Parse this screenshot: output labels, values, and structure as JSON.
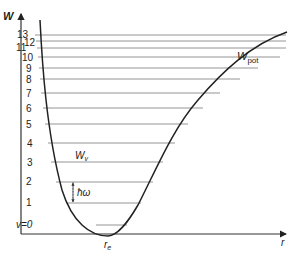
{
  "diagram": {
    "y_axis_label": "W",
    "x_axis_label": "r",
    "curve_label_main": "W",
    "curve_label_sub": "pot",
    "level_energy_label_main": "W",
    "level_energy_label_sub": "v",
    "spacing_label": "ħω",
    "equilibrium_label_main": "r",
    "equilibrium_label_sub": "e",
    "levels": [
      {
        "label": "v=0",
        "y": 225,
        "x1": 96,
        "x2": 127
      },
      {
        "label": "1",
        "y": 203,
        "x1": 66,
        "x2": 141
      },
      {
        "label": "2",
        "y": 182,
        "x1": 56,
        "x2": 153
      },
      {
        "label": "3",
        "y": 162,
        "x1": 51,
        "x2": 163
      },
      {
        "label": "4",
        "y": 143,
        "x1": 48,
        "x2": 175
      },
      {
        "label": "5",
        "y": 124,
        "x1": 45,
        "x2": 188
      },
      {
        "label": "6",
        "y": 108,
        "x1": 43,
        "x2": 203
      },
      {
        "label": "7",
        "y": 93,
        "x1": 41,
        "x2": 220
      },
      {
        "label": "8",
        "y": 79,
        "x1": 40,
        "x2": 240
      },
      {
        "label": "9",
        "y": 68,
        "x1": 39,
        "x2": 258
      },
      {
        "label": "10",
        "y": 57,
        "x1": 38,
        "x2": 280
      },
      {
        "label": "11",
        "y": 48,
        "x1": 37,
        "x2": 286
      },
      {
        "label": "12",
        "y": 41,
        "x1": 36,
        "x2": 286
      },
      {
        "label": "13",
        "y": 35,
        "x1": 35,
        "x2": 286
      }
    ],
    "colors": {
      "curve": "#222222",
      "levels": "#888888",
      "axes": "#333333"
    }
  }
}
